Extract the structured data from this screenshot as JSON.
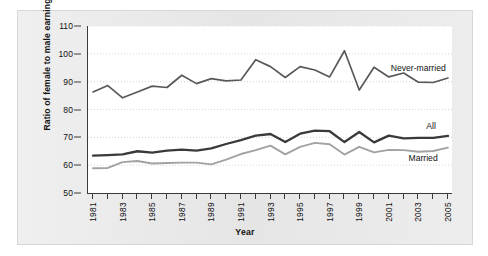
{
  "chart_data": {
    "type": "line",
    "title": "",
    "xlabel": "Year",
    "ylabel": "Ratio of female to male earnings",
    "xlim": [
      1981,
      2005
    ],
    "ylim": [
      50,
      110
    ],
    "yticks": [
      50,
      60,
      70,
      80,
      90,
      100,
      110
    ],
    "xticks": [
      1981,
      1982,
      1983,
      1984,
      1985,
      1986,
      1987,
      1988,
      1989,
      1990,
      1991,
      1992,
      1993,
      1994,
      1995,
      1996,
      1997,
      1998,
      1999,
      2000,
      2001,
      2002,
      2003,
      2004,
      2005
    ],
    "xtick_labels": [
      "1981",
      "",
      "1983",
      "",
      "1985",
      "",
      "1987",
      "",
      "1989",
      "",
      "1991",
      "",
      "1993",
      "",
      "1995",
      "",
      "1997",
      "",
      "1999",
      "",
      "2001",
      "",
      "2003",
      "",
      "2005"
    ],
    "grid": "horizontal-dotted",
    "legend_position": "inline-right",
    "x": [
      1981,
      1982,
      1983,
      1984,
      1985,
      1986,
      1987,
      1988,
      1989,
      1990,
      1991,
      1992,
      1993,
      1994,
      1995,
      1996,
      1997,
      1998,
      1999,
      2000,
      2001,
      2002,
      2003,
      2004,
      2005
    ],
    "series": [
      {
        "name": "Never-married",
        "color": "#595959",
        "width": 1.7,
        "values": [
          86.3,
          88.6,
          84.2,
          86.3,
          88.4,
          87.9,
          92.3,
          89.3,
          91.1,
          90.3,
          90.6,
          97.9,
          95.4,
          91.5,
          95.4,
          94.2,
          91.7,
          101.1,
          87.0,
          95.2,
          91.7,
          93.1,
          89.8,
          89.7,
          91.3
        ]
      },
      {
        "name": "All",
        "color": "#3a3a3a",
        "width": 2.3,
        "values": [
          63.4,
          63.6,
          63.9,
          65.0,
          64.5,
          65.2,
          65.6,
          65.2,
          66.0,
          67.6,
          69.0,
          70.6,
          71.2,
          68.3,
          71.3,
          72.4,
          72.2,
          68.3,
          71.9,
          68.2,
          70.6,
          69.6,
          69.8,
          69.8,
          70.5
        ]
      },
      {
        "name": "Married",
        "color": "#a2a2a2",
        "width": 1.9,
        "values": [
          58.9,
          59.0,
          61.1,
          61.5,
          60.6,
          60.8,
          60.9,
          60.9,
          60.3,
          62.0,
          64.0,
          65.4,
          67.0,
          63.9,
          66.6,
          68.0,
          67.5,
          63.8,
          66.6,
          64.6,
          65.5,
          65.4,
          64.8,
          65.1,
          66.3
        ]
      }
    ],
    "annotations": [
      {
        "text": "Never-married",
        "x": 2001.2,
        "y": 95.0
      },
      {
        "text": "All",
        "x": 2003.6,
        "y": 74.0
      },
      {
        "text": "Married",
        "x": 2002.4,
        "y": 62.5
      }
    ]
  },
  "figure": {
    "panel_background": "#e8e8e8",
    "plot_background": "#ffffff",
    "axis_color": "#3a3a3a",
    "grid_color": "#c9c9c9"
  }
}
